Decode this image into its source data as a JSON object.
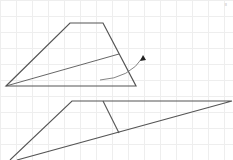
{
  "diagram": {
    "grid_spacing": 16,
    "stroke_color": "#555555",
    "grid_color": "#eeeeee",
    "corner_mark": "≡",
    "trapezoid": {
      "points": [
        [
          6,
          86
        ],
        [
          70,
          23
        ],
        [
          103,
          23
        ],
        [
          136,
          86
        ]
      ],
      "diagonal": [
        [
          6,
          86
        ],
        [
          119,
          54
        ]
      ]
    },
    "arrow": {
      "path": "M100 80 Q130 78 143 57",
      "head": [
        [
          143,
          55
        ],
        [
          140,
          61
        ],
        [
          146,
          60
        ]
      ]
    },
    "lower_shape": {
      "outline": [
        [
          10,
          160
        ],
        [
          72,
          101
        ],
        [
          232,
          101
        ],
        [
          17,
          160
        ]
      ],
      "segment": [
        [
          103,
          101
        ],
        [
          119,
          133
        ]
      ]
    }
  }
}
